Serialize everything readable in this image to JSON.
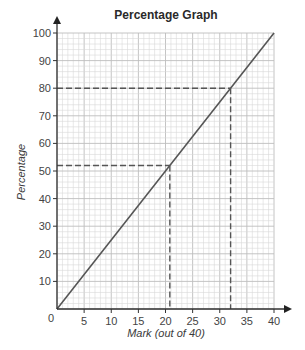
{
  "chart_data": {
    "type": "line",
    "title": "Percentage Graph",
    "xlabel": "Mark (out of 40)",
    "ylabel": "Percentage",
    "xlim": [
      0,
      40
    ],
    "ylim": [
      0,
      100
    ],
    "x_ticks": [
      0,
      5,
      10,
      15,
      20,
      25,
      30,
      35,
      40
    ],
    "y_ticks": [
      10,
      20,
      30,
      40,
      50,
      60,
      70,
      80,
      90,
      100
    ],
    "origin_label": "0",
    "grid": {
      "on": true,
      "minor_x_step": 1,
      "minor_y_step": 2,
      "major_x_step": 5,
      "major_y_step": 10
    },
    "series": [
      {
        "name": "Percentage",
        "x": [
          0,
          40
        ],
        "y": [
          0,
          100
        ],
        "color": "#555555"
      }
    ],
    "annotations": [
      {
        "type": "dashed-reading",
        "x": 32,
        "y": 80,
        "color": "#555555"
      },
      {
        "type": "dashed-reading",
        "x": 20.8,
        "y": 52,
        "color": "#555555"
      }
    ],
    "legend": null
  },
  "colors": {
    "grid_minor": "#d9d9d9",
    "grid_major": "#bdbdbd",
    "axis": "#333333",
    "line": "#555555"
  }
}
